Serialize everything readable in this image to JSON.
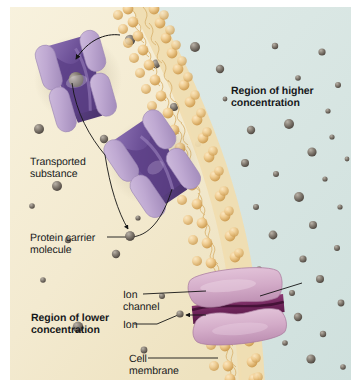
{
  "figure": {
    "alt": "Diagram of a curved phospholipid bilayer cell membrane showing two protein carrier molecules transporting a substance and an ion channel, with a region of higher concentration outside and a region of lower concentration inside"
  },
  "labels": {
    "region_higher": "Region of higher\nconcentration",
    "transported_substance": "Transported\nsubstance",
    "protein_carrier": "Protein carrier\nmolecule",
    "region_lower": "Region of lower\nconcentration",
    "ion_channel": "Ion\nchannel",
    "ion": "Ion",
    "cell_membrane": "Cell\nmembrane"
  },
  "colors": {
    "outside_background": "#dbe8e5",
    "inside_background": "#f4ecd2",
    "membrane_head": "#eec98d",
    "membrane_head_dark": "#d8a95f",
    "membrane_tail": "#f0dcae",
    "carrier_protein_light": "#c3afd2",
    "carrier_protein_dark": "#6b4f96",
    "ion_channel_light": "#d9b2cd",
    "ion_channel_dark": "#7b2f66",
    "particle": "#8a8278",
    "particle_dark": "#5d564e",
    "leader_line": "#1a1a1a",
    "text": "#16181a",
    "plate_border": "#ffffff"
  },
  "structures": {
    "carrier_top": {
      "name": "protein carrier molecule (upper)",
      "state": "substance bound inside funnel"
    },
    "carrier_middle": {
      "name": "protein carrier molecule (middle)",
      "state": "releasing substance to interior"
    },
    "ion_channel": {
      "name": "ion channel",
      "state": "open pore conducting ion inward"
    }
  },
  "arrows": {
    "into_top_carrier": "particle moving from outside into upper carrier funnel",
    "out_of_middle_carrier": "particle released from middle carrier into cell interior",
    "into_ion_channel": "ion moving leftward through channel into cell"
  }
}
